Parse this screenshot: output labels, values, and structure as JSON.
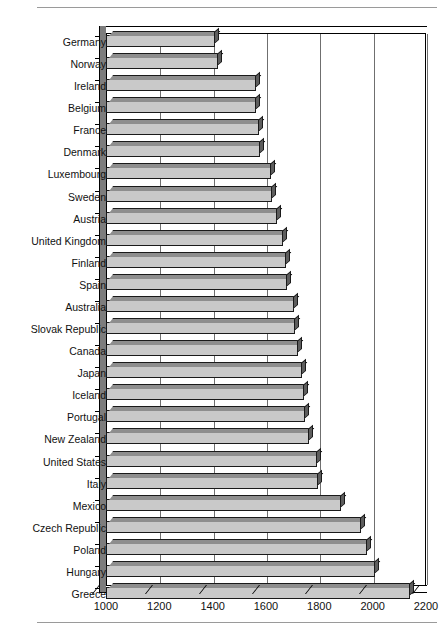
{
  "chart_data": {
    "type": "bar",
    "orientation": "horizontal",
    "title": "",
    "xlabel": "",
    "ylabel": "",
    "xlim": [
      1000,
      2200
    ],
    "xticks": [
      1000,
      1200,
      1400,
      1600,
      1800,
      2000,
      2200
    ],
    "xticklabels": [
      "1000",
      "1200",
      "1400",
      "1600",
      "1800",
      "2000",
      "2200"
    ],
    "grid": "vertical",
    "legend": "none",
    "style": "3d-bar",
    "categories": [
      "Germany",
      "Norway",
      "Ireland",
      "Belgium",
      "France",
      "Denmark",
      "Luxembourg",
      "Sweden",
      "Austria",
      "United Kingdom",
      "Finland",
      "Spain",
      "Australia",
      "Slovak Republic",
      "Canada",
      "Japan",
      "Iceland",
      "Portugal",
      "New Zealand",
      "United States",
      "Italy",
      "Mexico",
      "Czech Republic",
      "Poland",
      "Hungary",
      "Greece"
    ],
    "values": [
      1408,
      1420,
      1562,
      1562,
      1573,
      1577,
      1620,
      1623,
      1642,
      1665,
      1675,
      1680,
      1705,
      1708,
      1720,
      1735,
      1742,
      1748,
      1760,
      1790,
      1795,
      1880,
      1955,
      1980,
      2010,
      2140
    ],
    "colors": {
      "bar_face": "#c9c9c9",
      "bar_top": "#8e8e8e",
      "bar_side": "#5d5d5d",
      "bar_outline": "#1a1a1a",
      "gridline": "#6f6f6f",
      "axis": "#000000",
      "plot_background": "#ffffff",
      "rule": "#9a9a9a"
    }
  }
}
